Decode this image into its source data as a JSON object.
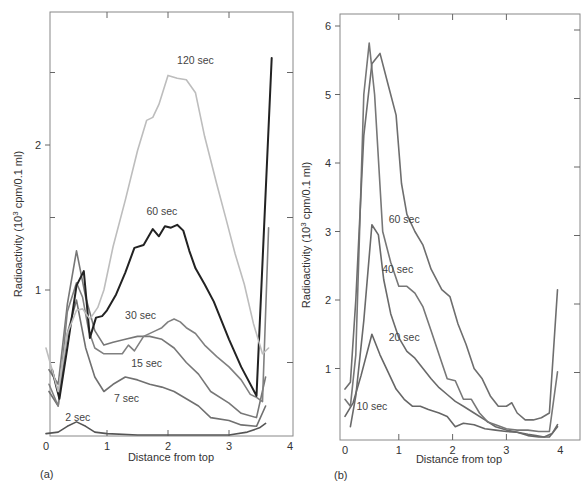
{
  "chart_data": [
    {
      "panel": "(a)",
      "type": "line",
      "title": "",
      "xlabel": "Distance from top",
      "ylabel": "Radioactivity (10³ cpm/0.1 ml)",
      "xlim": [
        0,
        4
      ],
      "ylim": [
        0,
        2.9
      ],
      "xticks": [
        "0",
        "1",
        "2",
        "3",
        "4"
      ],
      "yticks": [
        "1",
        "2"
      ],
      "grid": false,
      "legend": "inline labels",
      "series": [
        {
          "name": "2 sec",
          "color": "#555555",
          "width": 1.6,
          "x": [
            0.0,
            0.2,
            0.35,
            0.5,
            0.65,
            0.8,
            1.0,
            1.5,
            2.0,
            2.5,
            3.0,
            3.3,
            3.5,
            3.6
          ],
          "y": [
            0.01,
            0.02,
            0.06,
            0.09,
            0.06,
            0.02,
            0.01,
            0.0,
            0.0,
            0.0,
            0.0,
            0.02,
            0.05,
            0.08
          ]
        },
        {
          "name": "7 sec",
          "color": "#707070",
          "width": 1.6,
          "x": [
            0.05,
            0.2,
            0.35,
            0.5,
            0.65,
            0.8,
            0.95,
            1.1,
            1.3,
            1.5,
            1.7,
            1.9,
            2.1,
            2.3,
            2.5,
            2.7,
            3.0,
            3.2,
            3.45,
            3.6
          ],
          "y": [
            0.3,
            0.2,
            0.7,
            0.93,
            0.6,
            0.4,
            0.3,
            0.35,
            0.4,
            0.38,
            0.35,
            0.33,
            0.3,
            0.25,
            0.2,
            0.12,
            0.1,
            0.07,
            0.06,
            0.2
          ]
        },
        {
          "name": "15 sec",
          "color": "#777777",
          "width": 1.6,
          "x": [
            0.05,
            0.2,
            0.35,
            0.5,
            0.65,
            0.8,
            0.95,
            1.1,
            1.3,
            1.5,
            1.7,
            1.9,
            2.1,
            2.3,
            2.5,
            2.7,
            3.0,
            3.2,
            3.45,
            3.6
          ],
          "y": [
            0.45,
            0.35,
            0.9,
            1.27,
            0.95,
            0.72,
            0.62,
            0.64,
            0.66,
            0.68,
            0.68,
            0.66,
            0.6,
            0.5,
            0.42,
            0.3,
            0.22,
            0.15,
            0.12,
            0.4
          ]
        },
        {
          "name": "30 sec",
          "color": "#808080",
          "width": 1.6,
          "x": [
            0.05,
            0.2,
            0.35,
            0.5,
            0.6,
            0.7,
            0.8,
            0.95,
            1.1,
            1.25,
            1.35,
            1.45,
            1.6,
            1.8,
            1.9,
            2.0,
            2.1,
            2.2,
            2.3,
            2.45,
            2.6,
            2.8,
            3.0,
            3.2,
            3.35,
            3.45,
            3.55,
            3.65
          ],
          "y": [
            0.35,
            0.2,
            0.85,
            1.05,
            0.95,
            0.72,
            0.6,
            0.56,
            0.56,
            0.56,
            0.62,
            0.58,
            0.68,
            0.72,
            0.74,
            0.78,
            0.8,
            0.78,
            0.74,
            0.7,
            0.62,
            0.54,
            0.47,
            0.38,
            0.28,
            0.26,
            0.23,
            1.43
          ]
        },
        {
          "name": "60 sec",
          "color": "#222222",
          "width": 2.0,
          "x": [
            0.1,
            0.22,
            0.35,
            0.5,
            0.62,
            0.72,
            0.82,
            0.92,
            1.0,
            1.15,
            1.3,
            1.45,
            1.6,
            1.75,
            1.85,
            1.95,
            2.05,
            2.15,
            2.25,
            2.35,
            2.45,
            2.6,
            2.75,
            3.0,
            3.2,
            3.45,
            3.7
          ],
          "y": [
            0.45,
            0.25,
            0.6,
            1.03,
            1.13,
            0.67,
            0.81,
            0.82,
            0.86,
            0.97,
            1.12,
            1.29,
            1.31,
            1.42,
            1.37,
            1.44,
            1.43,
            1.45,
            1.41,
            1.27,
            1.15,
            1.04,
            0.92,
            0.66,
            0.47,
            0.27,
            2.6
          ]
        },
        {
          "name": "120 sec",
          "color": "#bdbdbd",
          "width": 1.6,
          "x": [
            0.0,
            0.2,
            0.35,
            0.5,
            0.6,
            0.72,
            0.85,
            0.95,
            1.1,
            1.3,
            1.5,
            1.65,
            1.75,
            1.85,
            2.0,
            2.15,
            2.3,
            2.45,
            2.6,
            2.8,
            2.95,
            3.1,
            3.25,
            3.4,
            3.55,
            3.65
          ],
          "y": [
            0.6,
            0.3,
            0.7,
            0.86,
            0.87,
            0.8,
            0.88,
            1.0,
            1.3,
            1.62,
            1.96,
            2.17,
            2.19,
            2.28,
            2.48,
            2.46,
            2.45,
            2.36,
            2.06,
            1.73,
            1.49,
            1.25,
            1.04,
            0.77,
            0.56,
            0.6
          ]
        }
      ],
      "annotations": [
        {
          "text": "120 sec",
          "x": 2.45,
          "y": 2.56
        },
        {
          "text": "60 sec",
          "x": 1.9,
          "y": 1.52
        },
        {
          "text": "30 sec",
          "x": 1.55,
          "y": 0.8
        },
        {
          "text": "15 sec",
          "x": 1.65,
          "y": 0.47
        },
        {
          "text": "7 sec",
          "x": 1.32,
          "y": 0.23
        },
        {
          "text": "2 sec",
          "x": 0.52,
          "y": 0.1
        }
      ]
    },
    {
      "panel": "(b)",
      "type": "line",
      "title": "",
      "xlabel": "Distance from top",
      "ylabel": "Radioactivity (10³ cpm/0.1 ml)",
      "xlim": [
        0,
        4
      ],
      "ylim": [
        0,
        6.1
      ],
      "xticks": [
        "0",
        "1",
        "2",
        "3",
        "4"
      ],
      "yticks": [
        "1",
        "2",
        "3",
        "4",
        "5",
        "6"
      ],
      "grid": false,
      "legend": "inline labels",
      "series": [
        {
          "name": "10 sec",
          "color": "#666666",
          "width": 1.6,
          "x": [
            0.0,
            0.15,
            0.3,
            0.5,
            0.65,
            0.8,
            0.95,
            1.1,
            1.25,
            1.4,
            1.55,
            1.75,
            1.9,
            2.05,
            2.2,
            2.4,
            2.6,
            2.8,
            3.0,
            3.2,
            3.4,
            3.6,
            3.8,
            3.95
          ],
          "y": [
            0.3,
            0.5,
            0.9,
            1.5,
            1.2,
            0.95,
            0.7,
            0.55,
            0.45,
            0.45,
            0.4,
            0.35,
            0.3,
            0.15,
            0.2,
            0.18,
            0.12,
            0.1,
            0.08,
            0.07,
            0.02,
            0.0,
            0.0,
            0.15
          ]
        },
        {
          "name": "20 sec",
          "color": "#6a6a6a",
          "width": 1.6,
          "x": [
            0.1,
            0.2,
            0.35,
            0.5,
            0.62,
            0.72,
            0.85,
            1.0,
            1.15,
            1.3,
            1.45,
            1.6,
            1.75,
            1.9,
            2.05,
            2.2,
            2.4,
            2.6,
            2.8,
            3.0,
            3.2,
            3.4,
            3.55,
            3.7,
            3.85,
            3.95
          ],
          "y": [
            0.15,
            0.6,
            1.7,
            3.1,
            2.95,
            2.3,
            1.8,
            1.45,
            1.25,
            1.15,
            1.0,
            0.85,
            0.72,
            0.62,
            0.52,
            0.45,
            0.35,
            0.25,
            0.15,
            0.1,
            0.07,
            0.04,
            0.02,
            0.0,
            0.05,
            0.18
          ]
        },
        {
          "name": "40 sec",
          "color": "#777777",
          "width": 1.6,
          "x": [
            0.0,
            0.1,
            0.2,
            0.35,
            0.45,
            0.55,
            0.7,
            0.85,
            1.0,
            1.15,
            1.3,
            1.45,
            1.6,
            1.75,
            1.9,
            2.05,
            2.2,
            2.35,
            2.5,
            2.65,
            2.8,
            3.0,
            3.2,
            3.4,
            3.6,
            3.8,
            3.95
          ],
          "y": [
            0.55,
            0.45,
            1.2,
            5.0,
            5.75,
            5.0,
            3.0,
            2.55,
            2.2,
            2.2,
            2.1,
            1.9,
            1.55,
            1.2,
            0.85,
            0.82,
            0.55,
            0.55,
            0.35,
            0.22,
            0.18,
            0.12,
            0.1,
            0.1,
            0.08,
            0.08,
            0.95
          ]
        },
        {
          "name": "60 sec",
          "color": "#6e6e6e",
          "width": 1.6,
          "x": [
            0.0,
            0.1,
            0.2,
            0.35,
            0.5,
            0.65,
            0.8,
            0.95,
            1.05,
            1.15,
            1.3,
            1.45,
            1.6,
            1.8,
            1.95,
            2.1,
            2.25,
            2.4,
            2.55,
            2.7,
            2.85,
            3.0,
            3.1,
            3.2,
            3.35,
            3.5,
            3.65,
            3.8,
            3.95
          ],
          "y": [
            0.7,
            0.8,
            2.0,
            4.4,
            5.45,
            5.6,
            5.15,
            4.7,
            3.7,
            3.25,
            3.0,
            2.8,
            2.45,
            2.15,
            2.05,
            1.65,
            1.35,
            1.0,
            0.85,
            0.6,
            0.45,
            0.45,
            0.5,
            0.35,
            0.25,
            0.25,
            0.28,
            0.35,
            2.15
          ]
        }
      ],
      "annotations": [
        {
          "text": "60 sec",
          "x": 1.1,
          "y": 3.12
        },
        {
          "text": "40 sec",
          "x": 0.98,
          "y": 2.4
        },
        {
          "text": "20 sec",
          "x": 1.1,
          "y": 1.4
        },
        {
          "text": "10 sec",
          "x": 0.5,
          "y": 0.4
        }
      ]
    }
  ],
  "panels": {
    "a": {
      "label": "(a)",
      "xlabel": "Distance from top",
      "ylabel_main": "Radioactivity (10",
      "ylabel_sup": "3",
      "ylabel_tail": " cpm/0.1 ml)",
      "xticks": [
        "0",
        "1",
        "2",
        "3",
        "4"
      ],
      "yticks": [
        "1",
        "2"
      ],
      "curve_labels": [
        "120 sec",
        "60 sec",
        "30 sec",
        "15 sec",
        "7 sec",
        "2 sec"
      ]
    },
    "b": {
      "label": "(b)",
      "xlabel": "Distance from top",
      "ylabel_main": "Radioactivity (10",
      "ylabel_sup": "3",
      "ylabel_tail": " cpm/0.1 ml)",
      "xticks": [
        "0",
        "1",
        "2",
        "3",
        "4"
      ],
      "yticks": [
        "1",
        "2",
        "3",
        "4",
        "5",
        "6"
      ],
      "curve_labels": [
        "60 sec",
        "40 sec",
        "20 sec",
        "10 sec"
      ]
    }
  }
}
